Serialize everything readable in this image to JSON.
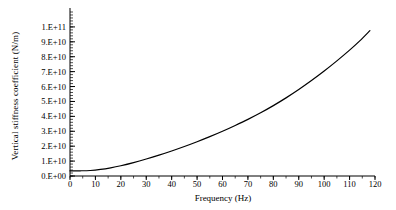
{
  "chart_data": {
    "type": "line",
    "title": "",
    "xlabel": "Frequency (Hz)",
    "ylabel": "Vertical stiffness coefficient (N/m)",
    "xlim": [
      0,
      120
    ],
    "ylim": [
      0,
      110000000000
    ],
    "grid": false,
    "legend": null,
    "x_ticks": [
      0,
      10,
      20,
      30,
      40,
      50,
      60,
      70,
      80,
      90,
      100,
      110,
      120
    ],
    "x_tick_labels": [
      "0",
      "10",
      "20",
      "30",
      "40",
      "50",
      "60",
      "70",
      "80",
      "90",
      "100",
      "110",
      "120"
    ],
    "y_ticks": [
      0,
      10000000000,
      20000000000,
      30000000000,
      40000000000,
      50000000000,
      60000000000,
      70000000000,
      80000000000,
      90000000000,
      100000000000
    ],
    "y_tick_labels": [
      "0.E+00",
      "1.E+10",
      "2.E+10",
      "3.E+10",
      "4.E+10",
      "5.E+10",
      "6.E+10",
      "7.E+10",
      "8.E+10",
      "9.E+10",
      "1.E+11"
    ],
    "series": [
      {
        "name": "Vertical stiffness coefficient",
        "color": "#000000",
        "line_width": 1.2,
        "x": [
          0,
          4,
          8,
          12,
          16,
          20,
          25,
          30,
          35,
          40,
          45,
          50,
          55,
          60,
          65,
          70,
          75,
          80,
          85,
          90,
          95,
          100,
          105,
          110,
          114,
          118
        ],
        "y": [
          3500000000,
          3500000000,
          3700000000,
          4400000000,
          5500000000,
          6900000000,
          9000000000,
          11400000000,
          14000000000,
          16800000000,
          19800000000,
          23000000000,
          26400000000,
          30000000000,
          33900000000,
          38000000000,
          42400000000,
          47200000000,
          52400000000,
          58000000000,
          64000000000,
          70400000000,
          77200000000,
          84400000000,
          90600000000,
          97500000000
        ]
      }
    ]
  },
  "axes": {
    "y_axis_name": "y-axis",
    "x_axis_name": "x-axis"
  }
}
